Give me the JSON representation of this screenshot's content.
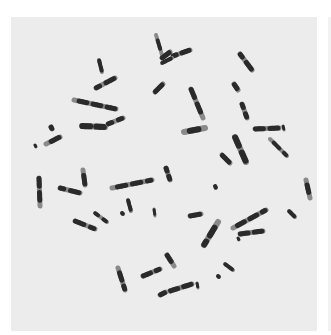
{
  "image": {
    "subject": "metaphase chromosome spread (G-banded)",
    "alt": "Micrograph of banded chromosomes scattered on a light gray background",
    "background_color": "#ececec",
    "chromosome_color": "#2a2a2a",
    "band_light_color": "#8a8a8a"
  },
  "chromosomes": [
    {
      "x1": 99,
      "y1": 60,
      "x2": 102,
      "y2": 72,
      "w": 4
    },
    {
      "x1": 96,
      "y1": 88,
      "x2": 115,
      "y2": 78,
      "w": 5
    },
    {
      "x1": 74,
      "y1": 100,
      "x2": 116,
      "y2": 109,
      "w": 5
    },
    {
      "x1": 82,
      "y1": 126,
      "x2": 105,
      "y2": 127,
      "w": 6
    },
    {
      "x1": 108,
      "y1": 124,
      "x2": 123,
      "y2": 118,
      "w": 5
    },
    {
      "x1": 46,
      "y1": 144,
      "x2": 60,
      "y2": 137,
      "w": 5
    },
    {
      "x1": 51,
      "y1": 127,
      "x2": 52,
      "y2": 129,
      "w": 5
    },
    {
      "x1": 35,
      "y1": 145,
      "x2": 36,
      "y2": 147,
      "w": 3
    },
    {
      "x1": 156,
      "y1": 35,
      "x2": 162,
      "y2": 55,
      "w": 4
    },
    {
      "x1": 162,
      "y1": 58,
      "x2": 170,
      "y2": 52,
      "w": 5
    },
    {
      "x1": 173,
      "y1": 56,
      "x2": 190,
      "y2": 50,
      "w": 5
    },
    {
      "x1": 155,
      "y1": 92,
      "x2": 163,
      "y2": 84,
      "w": 5
    },
    {
      "x1": 162,
      "y1": 63,
      "x2": 172,
      "y2": 58,
      "w": 4
    },
    {
      "x1": 240,
      "y1": 54,
      "x2": 252,
      "y2": 70,
      "w": 5
    },
    {
      "x1": 234,
      "y1": 84,
      "x2": 238,
      "y2": 90,
      "w": 5
    },
    {
      "x1": 191,
      "y1": 89,
      "x2": 203,
      "y2": 118,
      "w": 5
    },
    {
      "x1": 242,
      "y1": 104,
      "x2": 247,
      "y2": 118,
      "w": 5
    },
    {
      "x1": 184,
      "y1": 132,
      "x2": 205,
      "y2": 128,
      "w": 6
    },
    {
      "x1": 255,
      "y1": 129,
      "x2": 279,
      "y2": 128,
      "w": 5
    },
    {
      "x1": 283,
      "y1": 126,
      "x2": 284,
      "y2": 130,
      "w": 3
    },
    {
      "x1": 270,
      "y1": 139,
      "x2": 287,
      "y2": 156,
      "w": 4
    },
    {
      "x1": 235,
      "y1": 137,
      "x2": 246,
      "y2": 162,
      "w": 6
    },
    {
      "x1": 222,
      "y1": 155,
      "x2": 230,
      "y2": 163,
      "w": 5
    },
    {
      "x1": 83,
      "y1": 170,
      "x2": 85,
      "y2": 185,
      "w": 5
    },
    {
      "x1": 39,
      "y1": 178,
      "x2": 40,
      "y2": 206,
      "w": 5
    },
    {
      "x1": 60,
      "y1": 188,
      "x2": 80,
      "y2": 193,
      "w": 5
    },
    {
      "x1": 112,
      "y1": 188,
      "x2": 152,
      "y2": 180,
      "w": 5
    },
    {
      "x1": 128,
      "y1": 200,
      "x2": 131,
      "y2": 211,
      "w": 4
    },
    {
      "x1": 122,
      "y1": 213,
      "x2": 123,
      "y2": 214,
      "w": 4
    },
    {
      "x1": 154,
      "y1": 209,
      "x2": 155,
      "y2": 216,
      "w": 3
    },
    {
      "x1": 75,
      "y1": 221,
      "x2": 95,
      "y2": 229,
      "w": 5
    },
    {
      "x1": 95,
      "y1": 213,
      "x2": 107,
      "y2": 222,
      "w": 4
    },
    {
      "x1": 118,
      "y1": 268,
      "x2": 125,
      "y2": 290,
      "w": 5
    },
    {
      "x1": 143,
      "y1": 276,
      "x2": 160,
      "y2": 269,
      "w": 5
    },
    {
      "x1": 166,
      "y1": 168,
      "x2": 170,
      "y2": 180,
      "w": 5
    },
    {
      "x1": 215,
      "y1": 186,
      "x2": 216,
      "y2": 188,
      "w": 4
    },
    {
      "x1": 190,
      "y1": 216,
      "x2": 201,
      "y2": 214,
      "w": 5
    },
    {
      "x1": 204,
      "y1": 245,
      "x2": 218,
      "y2": 222,
      "w": 6
    },
    {
      "x1": 233,
      "y1": 228,
      "x2": 266,
      "y2": 210,
      "w": 5
    },
    {
      "x1": 240,
      "y1": 234,
      "x2": 263,
      "y2": 231,
      "w": 5
    },
    {
      "x1": 238,
      "y1": 238,
      "x2": 239,
      "y2": 240,
      "w": 3
    },
    {
      "x1": 306,
      "y1": 180,
      "x2": 310,
      "y2": 198,
      "w": 5
    },
    {
      "x1": 289,
      "y1": 211,
      "x2": 295,
      "y2": 217,
      "w": 4
    },
    {
      "x1": 225,
      "y1": 264,
      "x2": 233,
      "y2": 270,
      "w": 4
    },
    {
      "x1": 218,
      "y1": 276,
      "x2": 219,
      "y2": 277,
      "w": 4
    },
    {
      "x1": 170,
      "y1": 291,
      "x2": 192,
      "y2": 284,
      "w": 5
    },
    {
      "x1": 197,
      "y1": 283,
      "x2": 198,
      "y2": 288,
      "w": 3
    },
    {
      "x1": 160,
      "y1": 295,
      "x2": 166,
      "y2": 292,
      "w": 5
    },
    {
      "x1": 167,
      "y1": 255,
      "x2": 174,
      "y2": 266,
      "w": 5
    }
  ]
}
